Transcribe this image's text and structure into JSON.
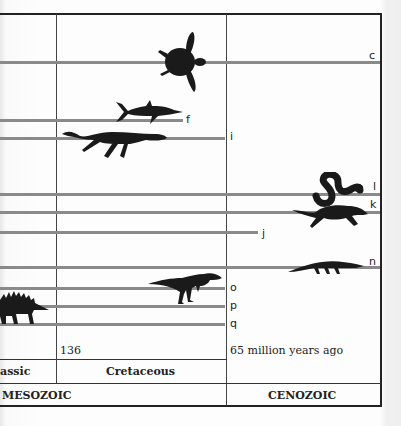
{
  "diagram": {
    "type": "geologic-timeline-lineage-chart",
    "colors": {
      "lineage_line": "#8a8a8a",
      "silhouette": "#1a1a1a",
      "border": "#222222"
    },
    "lineages": [
      {
        "label": "c",
        "y": 62,
        "x_start": 0,
        "x_end": 380,
        "animal": "sea-turtle"
      },
      {
        "label": "f",
        "y": 120,
        "x_start": 0,
        "x_end": 183,
        "animal": "ichthyosaur"
      },
      {
        "label": "i",
        "y": 138,
        "x_start": 0,
        "x_end": 225,
        "animal": "plesiosaur"
      },
      {
        "label": "l",
        "y": 194,
        "x_start": 0,
        "x_end": 380,
        "animal": "snake"
      },
      {
        "label": "k",
        "y": 212,
        "x_start": 0,
        "x_end": 380,
        "animal": "lizard"
      },
      {
        "label": "j",
        "y": 232,
        "x_start": 0,
        "x_end": 258,
        "animal": null
      },
      {
        "label": "n",
        "y": 267,
        "x_start": 0,
        "x_end": 380,
        "animal": "crocodile"
      },
      {
        "label": "o",
        "y": 288,
        "x_start": 0,
        "x_end": 225,
        "animal": "theropod-dinosaur"
      },
      {
        "label": "p",
        "y": 306,
        "x_start": 0,
        "x_end": 225,
        "animal": "stegosaur"
      },
      {
        "label": "q",
        "y": 324,
        "x_start": 0,
        "x_end": 225,
        "animal": null
      }
    ],
    "time_labels": {
      "boundary_136": "136",
      "boundary_65": "65 million years ago"
    },
    "periods": {
      "left": "assic",
      "middle": "Cretaceous"
    },
    "eras": {
      "left": "MESOZOIC",
      "right": "CENOZOIC"
    }
  }
}
